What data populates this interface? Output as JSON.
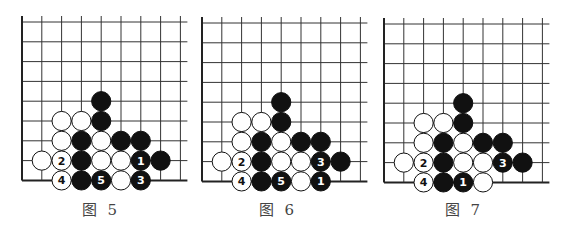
{
  "grid": {
    "lines": 9,
    "spacing": 19.8,
    "line_color": "#333333",
    "edge_color": "#222222",
    "stone_radius": 9.6
  },
  "colors": {
    "black_stone": "#111111",
    "white_stone": "#ffffff",
    "stone_outline": "#111111",
    "number_on_black": "#ffffff",
    "number_on_white": "#111111"
  },
  "boards": [
    {
      "id": "fig5",
      "caption": "图 5",
      "origin_x": 22,
      "origin_y": 22,
      "stones": [
        {
          "row": 4,
          "col": 4,
          "color": "black",
          "label": ""
        },
        {
          "row": 5,
          "col": 2,
          "color": "white",
          "label": ""
        },
        {
          "row": 5,
          "col": 3,
          "color": "white",
          "label": ""
        },
        {
          "row": 5,
          "col": 4,
          "color": "black",
          "label": ""
        },
        {
          "row": 6,
          "col": 2,
          "color": "white",
          "label": ""
        },
        {
          "row": 6,
          "col": 3,
          "color": "black",
          "label": ""
        },
        {
          "row": 6,
          "col": 4,
          "color": "white",
          "label": ""
        },
        {
          "row": 6,
          "col": 5,
          "color": "black",
          "label": ""
        },
        {
          "row": 6,
          "col": 6,
          "color": "black",
          "label": ""
        },
        {
          "row": 7,
          "col": 1,
          "color": "white",
          "label": ""
        },
        {
          "row": 7,
          "col": 2,
          "color": "white",
          "label": "2"
        },
        {
          "row": 7,
          "col": 3,
          "color": "black",
          "label": ""
        },
        {
          "row": 7,
          "col": 4,
          "color": "white",
          "label": ""
        },
        {
          "row": 7,
          "col": 5,
          "color": "white",
          "label": ""
        },
        {
          "row": 7,
          "col": 6,
          "color": "black",
          "label": "1"
        },
        {
          "row": 7,
          "col": 7,
          "color": "black",
          "label": ""
        },
        {
          "row": 8,
          "col": 2,
          "color": "white",
          "label": "4"
        },
        {
          "row": 8,
          "col": 3,
          "color": "black",
          "label": ""
        },
        {
          "row": 8,
          "col": 4,
          "color": "black",
          "label": "5"
        },
        {
          "row": 8,
          "col": 5,
          "color": "white",
          "label": ""
        },
        {
          "row": 8,
          "col": 6,
          "color": "black",
          "label": "3"
        }
      ]
    },
    {
      "id": "fig6",
      "caption": "图 6",
      "origin_x": 202,
      "origin_y": 23,
      "stones": [
        {
          "row": 4,
          "col": 4,
          "color": "black",
          "label": ""
        },
        {
          "row": 5,
          "col": 2,
          "color": "white",
          "label": ""
        },
        {
          "row": 5,
          "col": 3,
          "color": "white",
          "label": ""
        },
        {
          "row": 5,
          "col": 4,
          "color": "black",
          "label": ""
        },
        {
          "row": 6,
          "col": 2,
          "color": "white",
          "label": ""
        },
        {
          "row": 6,
          "col": 3,
          "color": "black",
          "label": ""
        },
        {
          "row": 6,
          "col": 4,
          "color": "white",
          "label": ""
        },
        {
          "row": 6,
          "col": 5,
          "color": "black",
          "label": ""
        },
        {
          "row": 6,
          "col": 6,
          "color": "black",
          "label": ""
        },
        {
          "row": 7,
          "col": 1,
          "color": "white",
          "label": ""
        },
        {
          "row": 7,
          "col": 2,
          "color": "white",
          "label": "2"
        },
        {
          "row": 7,
          "col": 3,
          "color": "black",
          "label": ""
        },
        {
          "row": 7,
          "col": 4,
          "color": "white",
          "label": ""
        },
        {
          "row": 7,
          "col": 5,
          "color": "white",
          "label": ""
        },
        {
          "row": 7,
          "col": 6,
          "color": "black",
          "label": "3"
        },
        {
          "row": 7,
          "col": 7,
          "color": "black",
          "label": ""
        },
        {
          "row": 8,
          "col": 2,
          "color": "white",
          "label": "4"
        },
        {
          "row": 8,
          "col": 3,
          "color": "black",
          "label": ""
        },
        {
          "row": 8,
          "col": 4,
          "color": "black",
          "label": "5"
        },
        {
          "row": 8,
          "col": 5,
          "color": "white",
          "label": ""
        },
        {
          "row": 8,
          "col": 6,
          "color": "black",
          "label": "1"
        }
      ]
    },
    {
      "id": "fig7",
      "caption": "图 7",
      "origin_x": 384,
      "origin_y": 24,
      "stones": [
        {
          "row": 4,
          "col": 4,
          "color": "black",
          "label": ""
        },
        {
          "row": 5,
          "col": 2,
          "color": "white",
          "label": ""
        },
        {
          "row": 5,
          "col": 3,
          "color": "white",
          "label": ""
        },
        {
          "row": 5,
          "col": 4,
          "color": "black",
          "label": ""
        },
        {
          "row": 6,
          "col": 2,
          "color": "white",
          "label": ""
        },
        {
          "row": 6,
          "col": 3,
          "color": "black",
          "label": ""
        },
        {
          "row": 6,
          "col": 4,
          "color": "white",
          "label": ""
        },
        {
          "row": 6,
          "col": 5,
          "color": "black",
          "label": ""
        },
        {
          "row": 6,
          "col": 6,
          "color": "black",
          "label": ""
        },
        {
          "row": 7,
          "col": 1,
          "color": "white",
          "label": ""
        },
        {
          "row": 7,
          "col": 2,
          "color": "white",
          "label": "2"
        },
        {
          "row": 7,
          "col": 3,
          "color": "black",
          "label": ""
        },
        {
          "row": 7,
          "col": 4,
          "color": "white",
          "label": ""
        },
        {
          "row": 7,
          "col": 5,
          "color": "white",
          "label": ""
        },
        {
          "row": 7,
          "col": 6,
          "color": "black",
          "label": "3"
        },
        {
          "row": 7,
          "col": 7,
          "color": "black",
          "label": ""
        },
        {
          "row": 8,
          "col": 2,
          "color": "white",
          "label": "4"
        },
        {
          "row": 8,
          "col": 3,
          "color": "black",
          "label": ""
        },
        {
          "row": 8,
          "col": 4,
          "color": "black",
          "label": "1"
        },
        {
          "row": 8,
          "col": 5,
          "color": "white",
          "label": ""
        }
      ]
    }
  ]
}
